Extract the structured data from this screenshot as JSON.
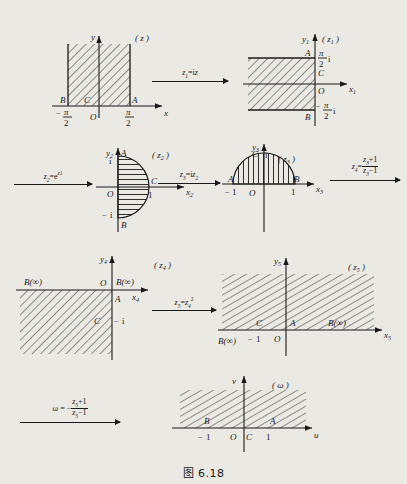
{
  "caption": "图 6.18",
  "panels": [
    {
      "id": "z",
      "label": "( z )",
      "xaxis": "x",
      "yaxis": "y",
      "origin": "O",
      "points": [
        {
          "name": "B",
          "tick": "-π/2"
        },
        {
          "name": "C",
          "tick": ""
        },
        {
          "name": "A",
          "tick": "π/2"
        }
      ],
      "region": "semi-infinite vertical strip, -π/2 < x < π/2, y > 0"
    },
    {
      "id": "z1",
      "label": "( z₁ )",
      "xaxis": "x₁",
      "yaxis": "y₁",
      "origin": "O",
      "points": [
        {
          "name": "A",
          "tick": "π/2 i"
        },
        {
          "name": "C",
          "tick": ""
        },
        {
          "name": "B",
          "tick": "-π/2 i"
        }
      ],
      "region": "semi-infinite horizontal strip, -π/2 < y < π/2, x < 0"
    },
    {
      "id": "z2",
      "label": "( z₂ )",
      "xaxis": "x₂",
      "yaxis": "y₂",
      "origin": "O",
      "points": [
        {
          "name": "A",
          "tick": "i"
        },
        {
          "name": "C",
          "tick": "1"
        },
        {
          "name": "B",
          "tick": "-i"
        }
      ],
      "region": "right half of unit disk"
    },
    {
      "id": "z3",
      "label": "( z₃ )",
      "xaxis": "x₃",
      "yaxis": "y₃",
      "origin": "O",
      "points": [
        {
          "name": "A",
          "tick": "-1"
        },
        {
          "name": "C",
          "tick": "i"
        },
        {
          "name": "B",
          "tick": "1"
        }
      ],
      "region": "upper half of unit disk"
    },
    {
      "id": "z4",
      "label": "( z₄ )",
      "xaxis": "x₄",
      "yaxis": "y₄",
      "origin": "O",
      "points": [
        {
          "name": "B(∞)",
          "tick": ""
        },
        {
          "name": "A",
          "tick": ""
        },
        {
          "name": "C",
          "tick": "-i"
        },
        {
          "name": "B(∞)",
          "tick": ""
        }
      ],
      "region": "third quadrant, x < 0 and y < 0"
    },
    {
      "id": "z5",
      "label": "( z₅ )",
      "xaxis": "x₅",
      "yaxis": "y₅",
      "origin": "O",
      "points": [
        {
          "name": "B(∞)",
          "tick": ""
        },
        {
          "name": "C",
          "tick": "-1"
        },
        {
          "name": "A",
          "tick": ""
        },
        {
          "name": "B(∞)",
          "tick": ""
        }
      ],
      "region": "upper half plane, y > 0"
    },
    {
      "id": "w",
      "label": "( ω )",
      "xaxis": "u",
      "yaxis": "v",
      "origin": "O",
      "points": [
        {
          "name": "B",
          "tick": "-1"
        },
        {
          "name": "C",
          "tick": ""
        },
        {
          "name": "A",
          "tick": "1"
        }
      ],
      "region": "rectangle -1 < u < 1, v > 0"
    }
  ],
  "arrows": [
    {
      "id": "arrow-1",
      "lhs": "z₁",
      "rel": "=",
      "rhs": "iz"
    },
    {
      "id": "arrow-2",
      "lhs": "z₂",
      "rel": "=",
      "rhs": "e^{z₁}"
    },
    {
      "id": "arrow-3",
      "lhs": "z₃",
      "rel": "=",
      "rhs": "iz₂"
    },
    {
      "id": "arrow-4",
      "lhs": "z₄",
      "rel": "=",
      "num": "z₃+1",
      "den": "z₃-1"
    },
    {
      "id": "arrow-5",
      "lhs": "z₅",
      "rel": "=",
      "rhs": "z₄²"
    },
    {
      "id": "arrow-6",
      "lhs": "ω",
      "rel": "= -",
      "num": "z₅+1",
      "den": "z₅-1"
    }
  ]
}
